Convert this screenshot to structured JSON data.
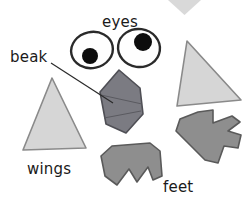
{
  "page": {
    "background_color": "#ffffff",
    "width": 252,
    "height": 205
  },
  "labels": {
    "eyes": "eyes",
    "beak": "beak",
    "wings": "wings",
    "feet": "feet",
    "text_color": "#1a1a1a"
  },
  "colors": {
    "wing_fill": "#d6d6d6",
    "wing_stroke": "#8a8a8a",
    "beak_fill": "#7b7b82",
    "beak_stroke": "#4f4f55",
    "foot_fill": "#8e8e8e",
    "foot_stroke": "#5a5a5a",
    "eye_fill": "#fefefe",
    "eye_stroke": "#2a2a2a",
    "pupil_fill": "#0d0d0d",
    "arrow_fill": "#d9d9d9",
    "leader_line": "#2a2a2a"
  },
  "shapes": {
    "top_arrow": {
      "name": "downward triangle marker",
      "points": "168,0 201,0 184.5,15"
    },
    "left_wing": {
      "name": "left light-gray triangle wing",
      "points": "52,78 23,150 86,148"
    },
    "right_wing": {
      "name": "right light-gray triangle wing",
      "points": "187,41 177,106 241,100"
    },
    "beak": {
      "name": "dark gray hexagonal beak",
      "points": "119,70 140,88 143,114 126,133 106,124 100,92"
    },
    "beak_fold_line": "101,95 142,104",
    "beak_fold_line2": "104,118 141,111",
    "left_eye": {
      "name": "left eye oval",
      "cx": 92,
      "cy": 50,
      "rx": 21,
      "ry": 18,
      "rotate": -12,
      "pupil_cx": 90,
      "pupil_cy": 56,
      "pupil_r": 8
    },
    "right_eye": {
      "name": "right eye oval",
      "cx": 139,
      "cy": 48,
      "rx": 21,
      "ry": 19,
      "rotate": 8,
      "pupil_cx": 143,
      "pupil_cy": 42,
      "pupil_r": 9
    },
    "bottom_foot": {
      "name": "bottom center foot",
      "points": "112,146 150,143 160,151 162,176 153,180 148,167 137,182 129,169 117,185 105,176 101,156"
    },
    "right_foot": {
      "name": "right foot claw",
      "points": "198,112 213,110 213,123 232,116 240,122 228,131 241,135 238,148 224,146 218,163 205,160 188,143 176,131 180,119"
    },
    "leader_line": {
      "name": "beak leader line",
      "x1": 51,
      "y1": 63,
      "x2": 113,
      "y2": 103
    }
  }
}
